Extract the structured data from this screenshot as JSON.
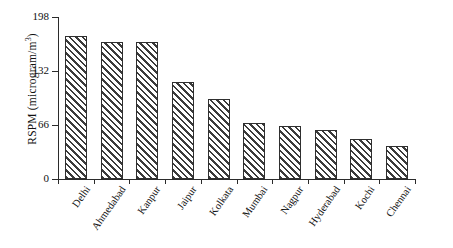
{
  "chart_data": {
    "type": "bar",
    "title": "",
    "xlabel": "",
    "ylabel": "RSPM (microgram/m3)",
    "ylabel_html": "RSPM (microgram/m<sup>3</sup>)",
    "ylim": [
      0,
      198
    ],
    "yticks": [
      0,
      66,
      132,
      198
    ],
    "ytick_labels": [
      "0",
      "66",
      "132",
      "198"
    ],
    "grid": false,
    "legend": null,
    "bar_style": {
      "fill": "diagonal-hatch",
      "hatch_direction": "forward-slash",
      "hatch_color": "#3b3b3b",
      "background_color": "#ffffff",
      "edge_color": "#2f2f2f"
    },
    "categories": [
      "Delhi",
      "Ahmedabad",
      "Kanpur",
      "Jaipur",
      "Kolkata",
      "Mumbai",
      "Nagpur",
      "Hyderabad",
      "Kochi",
      "Chennai"
    ],
    "values": [
      175,
      167,
      167,
      119,
      98,
      68,
      65,
      60,
      49,
      40
    ]
  },
  "figure": {
    "background_color": "#ffffff",
    "axis_color": "#2b2b2b",
    "text_color": "#111111"
  }
}
